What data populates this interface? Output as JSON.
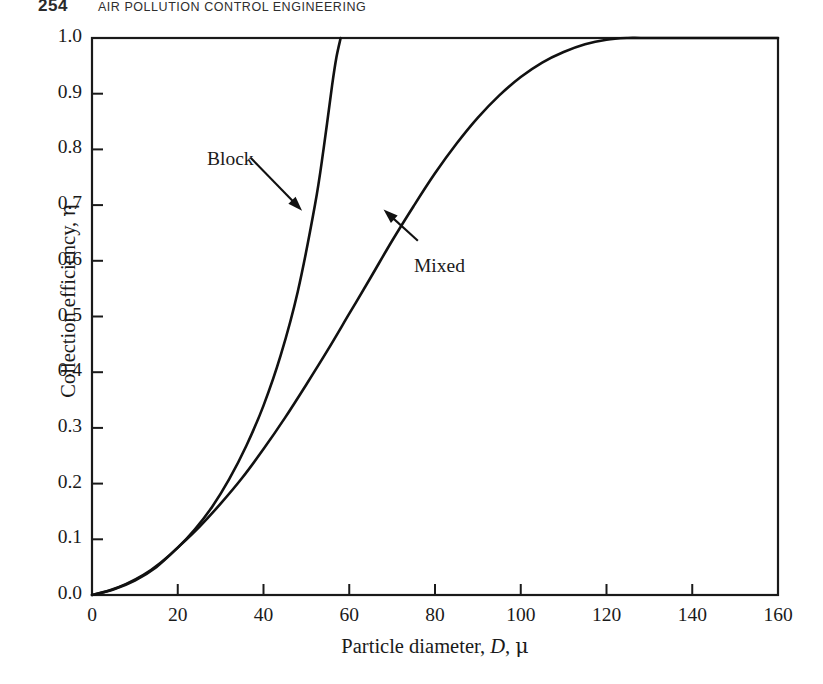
{
  "page_header": {
    "folio": "254",
    "running_head": "AIR POLLUTION CONTROL ENGINEERING"
  },
  "chart_data": {
    "type": "line",
    "title": "",
    "xlabel": "Particle diameter, D, μ",
    "ylabel": "Collection efficiency, η",
    "xlim": [
      0,
      160
    ],
    "ylim": [
      0.0,
      1.0
    ],
    "grid": false,
    "legend_position": "inline-annotations",
    "x_ticks": [
      "0",
      "20",
      "40",
      "60",
      "80",
      "100",
      "120",
      "140",
      "160"
    ],
    "x_tick_values": [
      0,
      20,
      40,
      60,
      80,
      100,
      120,
      140,
      160
    ],
    "y_ticks": [
      "0.0",
      "0.1",
      "0.2",
      "0.3",
      "0.4",
      "0.5",
      "0.6",
      "0.7",
      "0.8",
      "0.9",
      "1.0"
    ],
    "y_tick_values": [
      0.0,
      0.1,
      0.2,
      0.3,
      0.4,
      0.5,
      0.6,
      0.7,
      0.8,
      0.9,
      1.0
    ],
    "series": [
      {
        "name": "Block",
        "label": "Block",
        "color": "#111111",
        "x": [
          0,
          4,
          8,
          12,
          16,
          20,
          24,
          28,
          32,
          36,
          40,
          44,
          48,
          52,
          54,
          56,
          57,
          58
        ],
        "values": [
          0.0,
          0.008,
          0.02,
          0.036,
          0.058,
          0.085,
          0.118,
          0.158,
          0.208,
          0.268,
          0.34,
          0.43,
          0.545,
          0.7,
          0.8,
          0.915,
          0.965,
          1.0
        ]
      },
      {
        "name": "Mixed",
        "label": "Mixed",
        "color": "#111111",
        "x": [
          0,
          5,
          10,
          15,
          20,
          25,
          30,
          35,
          40,
          45,
          50,
          55,
          60,
          65,
          70,
          75,
          80,
          85,
          90,
          95,
          100,
          105,
          110,
          115,
          120,
          125,
          128,
          135,
          145,
          160
        ],
        "values": [
          0.0,
          0.01,
          0.026,
          0.05,
          0.085,
          0.122,
          0.164,
          0.21,
          0.262,
          0.318,
          0.378,
          0.44,
          0.505,
          0.57,
          0.636,
          0.698,
          0.757,
          0.81,
          0.857,
          0.897,
          0.93,
          0.956,
          0.975,
          0.989,
          0.997,
          1.0,
          1.0,
          1.0,
          1.0,
          1.0
        ]
      }
    ],
    "annotations": [
      {
        "text": "Block",
        "label_x": 27,
        "label_y": 0.815,
        "arrow_to_x": 49,
        "arrow_to_y": 0.69
      },
      {
        "text": "Mixed",
        "label_x": 78,
        "label_y": 0.625,
        "arrow_to_x": 68,
        "arrow_to_y": 0.692
      }
    ]
  }
}
